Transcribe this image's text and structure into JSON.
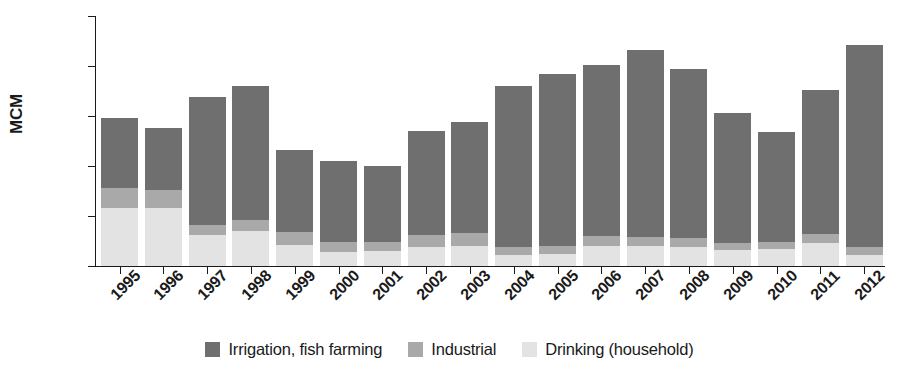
{
  "chart_data": {
    "type": "bar",
    "subtype": "stacked-bar",
    "title": "",
    "xlabel": "",
    "ylabel": "MCM",
    "ylim": [
      0,
      2500
    ],
    "yticks": [
      0,
      500,
      1000,
      1500,
      2000,
      2500
    ],
    "ytick_labels": [
      "0",
      "500",
      "1,000",
      "1,500",
      "2,000",
      "2,500"
    ],
    "grid": false,
    "legend_position": "bottom-center",
    "categories": [
      "1995",
      "1996",
      "1997",
      "1998",
      "1999",
      "2000",
      "2001",
      "2002",
      "2003",
      "2004",
      "2005",
      "2006",
      "2007",
      "2008",
      "2009",
      "2010",
      "2011",
      "2012"
    ],
    "series": [
      {
        "name": "Drinking (household)",
        "color": "#e3e3e3",
        "values": [
          580,
          580,
          310,
          350,
          210,
          140,
          150,
          190,
          200,
          110,
          120,
          200,
          200,
          190,
          160,
          170,
          230,
          110
        ]
      },
      {
        "name": "Industrial",
        "color": "#a9a9a9",
        "values": [
          200,
          180,
          100,
          110,
          130,
          100,
          90,
          120,
          130,
          80,
          80,
          100,
          90,
          90,
          70,
          70,
          90,
          80
        ]
      },
      {
        "name": "Irrigation, fish farming",
        "color": "#6f6f6f",
        "values": [
          700,
          620,
          1280,
          1340,
          820,
          810,
          760,
          1040,
          1110,
          1610,
          1720,
          1710,
          1870,
          1690,
          1300,
          1100,
          1440,
          2020
        ]
      }
    ],
    "totals": [
      1480,
      1380,
      1690,
      1800,
      1160,
      1050,
      1000,
      1350,
      1440,
      1800,
      1920,
      2010,
      2160,
      1970,
      1530,
      1340,
      1760,
      2210
    ]
  },
  "legend": {
    "items": [
      {
        "label": "Irrigation, fish farming",
        "color": "#6f6f6f"
      },
      {
        "label": "Industrial",
        "color": "#a9a9a9"
      },
      {
        "label": "Drinking (household)",
        "color": "#e3e3e3"
      }
    ]
  }
}
